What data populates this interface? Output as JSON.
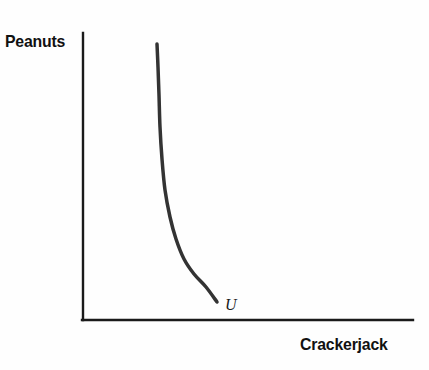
{
  "figure": {
    "background_color": "#fefefe",
    "width": 429,
    "height": 370
  },
  "axes": {
    "y_label": "Peanuts",
    "x_label": "Crackerjack",
    "axis_color": "#1a1a1a",
    "origin_x": 82,
    "origin_y": 320,
    "y_top": 33,
    "x_right": 413
  },
  "curve": {
    "label": "U",
    "color": "#333333",
    "stroke_width": 3.5
  },
  "chart_data": {
    "type": "line",
    "title": "",
    "subtitle": "",
    "xlabel": "Crackerjack",
    "ylabel": "Peanuts",
    "xlim": [
      0,
      100
    ],
    "ylim": [
      0,
      100
    ],
    "grid": false,
    "legend": "none",
    "xticks": [],
    "yticks": [],
    "xticklabels": [],
    "yticklabels": [],
    "annotations": [
      {
        "text": "U",
        "x": 43.5,
        "y": 4.0,
        "style": "italic",
        "note": "indifference curve label at lower-right end of curve"
      }
    ],
    "series": [
      {
        "name": "U",
        "type": "indifference-curve",
        "color": "#333333",
        "x": [
          22.7,
          22.9,
          23.2,
          23.6,
          24.2,
          25.1,
          26.4,
          28.2,
          30.6,
          33.7,
          37.3,
          40.8
        ],
        "y": [
          96.2,
          88.0,
          78.0,
          66.5,
          55.0,
          44.0,
          34.5,
          26.5,
          19.5,
          14.0,
          9.5,
          6.3
        ],
        "pixel_points": [
          [
            157,
            44
          ],
          [
            158,
            67
          ],
          [
            159,
            95
          ],
          [
            160,
            127
          ],
          [
            162,
            159
          ],
          [
            165,
            190
          ],
          [
            170,
            217
          ],
          [
            176,
            239
          ],
          [
            184,
            259
          ],
          [
            194,
            274
          ],
          [
            206,
            287
          ],
          [
            217,
            302
          ]
        ]
      }
    ]
  }
}
